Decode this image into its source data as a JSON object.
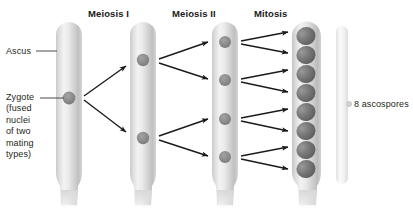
{
  "figure": {
    "background_color": "#ffffff",
    "text_color": "#231f20",
    "tube_fill_light": "#f4f4f4",
    "tube_fill_mid": "#d9d9d9",
    "tube_fill_shadow": "#bdbdbd",
    "nucleus_color": "#8c8c8c",
    "spore_color": "#6e6e6e",
    "arrow_color": "#1a1a1a",
    "bracket_color": "#ededed"
  },
  "stage_headers": [
    {
      "id": "meiosis-1",
      "label": "Meiosis I",
      "x": 88,
      "y": 8
    },
    {
      "id": "meiosis-2",
      "label": "Meiosis II",
      "x": 172,
      "y": 8
    },
    {
      "id": "mitosis",
      "label": "Mitosis",
      "x": 254,
      "y": 8
    }
  ],
  "side_labels": [
    {
      "id": "ascus",
      "label": "Ascus",
      "x": 6,
      "y": 47
    },
    {
      "id": "zygote",
      "label": "Zygote\n(fused\nnuclei\nof two\nmating\ntypes)",
      "x": 6,
      "y": 92
    }
  ],
  "result_label": {
    "id": "ascospores",
    "label": "8 ascospores",
    "x": 352,
    "y": 99
  },
  "tubes": [
    {
      "id": "tube-1",
      "stage": "zygote",
      "nuclei": 1,
      "x": 56,
      "width": 26,
      "top": 22,
      "bottom": 205
    },
    {
      "id": "tube-2",
      "stage": "after-meiosis-i",
      "nuclei": 2,
      "x": 130,
      "width": 26,
      "top": 22,
      "bottom": 205
    },
    {
      "id": "tube-3",
      "stage": "after-meiosis-ii",
      "nuclei": 4,
      "x": 212,
      "width": 26,
      "top": 22,
      "bottom": 205
    },
    {
      "id": "tube-4",
      "stage": "after-mitosis",
      "nuclei": 8,
      "x": 292,
      "width": 29,
      "top": 22,
      "bottom": 205
    }
  ],
  "nuclei_counts": [
    1,
    2,
    4,
    8
  ],
  "bracket": {
    "id": "ascospore-bracket",
    "x": 336,
    "y": 26,
    "width": 12,
    "height": 158
  },
  "leader_lines": [
    {
      "id": "ascus-leader",
      "from_x": 36,
      "from_y": 51,
      "to_x": 57,
      "to_y": 51
    },
    {
      "id": "zygote-leader",
      "from_x": 40,
      "from_y": 98,
      "to_x": 64,
      "to_y": 98
    }
  ],
  "arrow_groups": [
    {
      "id": "meiosis-i-arrows",
      "count": 2,
      "from_tube": "tube-1",
      "to_tube": "tube-2"
    },
    {
      "id": "meiosis-ii-arrows",
      "count": 4,
      "from_tube": "tube-2",
      "to_tube": "tube-3"
    },
    {
      "id": "mitosis-arrows",
      "count": 8,
      "from_tube": "tube-3",
      "to_tube": "tube-4"
    }
  ]
}
